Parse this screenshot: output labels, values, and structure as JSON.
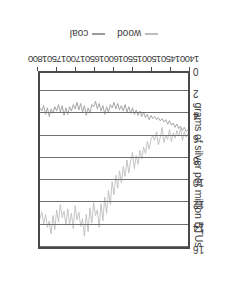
{
  "chart_data": {
    "type": "line",
    "title": "",
    "xlabel": "",
    "ylabel": "grams of silver per million BTUs",
    "xlim": [
      1400,
      1800
    ],
    "ylim": [
      0,
      16
    ],
    "grid": true,
    "legend_position": "bottom",
    "xticks": [
      1400,
      1450,
      1500,
      1550,
      1600,
      1650,
      1700,
      1750,
      1800
    ],
    "yticks": [
      0,
      2,
      4,
      6,
      8,
      10,
      12,
      14,
      16
    ],
    "series": [
      {
        "name": "wood",
        "color": "#bdbdbd",
        "x": [
          1400,
          1405,
          1410,
          1415,
          1420,
          1425,
          1430,
          1435,
          1440,
          1445,
          1450,
          1455,
          1460,
          1465,
          1470,
          1475,
          1480,
          1485,
          1490,
          1495,
          1500,
          1505,
          1510,
          1515,
          1520,
          1525,
          1530,
          1535,
          1540,
          1545,
          1550,
          1555,
          1560,
          1565,
          1570,
          1575,
          1580,
          1585,
          1590,
          1595,
          1600,
          1605,
          1610,
          1615,
          1620,
          1625,
          1630,
          1635,
          1640,
          1645,
          1650,
          1655,
          1660,
          1665,
          1670,
          1675,
          1680,
          1685,
          1690,
          1695,
          1700,
          1705,
          1710,
          1715,
          1720,
          1725,
          1730,
          1735,
          1740,
          1745,
          1750,
          1755,
          1760,
          1765,
          1770,
          1775,
          1780,
          1785,
          1790,
          1795,
          1800
        ],
        "values": [
          5.6,
          5.9,
          5.4,
          6.2,
          5.1,
          5.8,
          5.3,
          6.0,
          5.5,
          6.3,
          5.2,
          6.1,
          5.7,
          6.4,
          5.0,
          5.9,
          6.6,
          5.4,
          6.2,
          5.8,
          6.1,
          7.0,
          6.3,
          7.4,
          6.8,
          7.9,
          7.1,
          8.4,
          7.6,
          8.8,
          7.3,
          8.1,
          9.2,
          8.0,
          9.5,
          8.6,
          10.1,
          9.0,
          10.6,
          9.4,
          11.2,
          10.0,
          12.1,
          10.8,
          12.9,
          11.4,
          13.6,
          12.0,
          14.2,
          12.6,
          13.1,
          11.9,
          13.8,
          12.4,
          14.6,
          13.0,
          15.0,
          13.4,
          14.1,
          12.8,
          13.5,
          12.2,
          14.3,
          12.9,
          13.9,
          12.5,
          14.0,
          12.7,
          13.3,
          12.1,
          13.7,
          12.6,
          14.4,
          13.1,
          14.8,
          13.6,
          14.2,
          13.0,
          13.9,
          12.8,
          13.4
        ]
      },
      {
        "name": "coal",
        "color": "#9a9a9a",
        "x": [
          1400,
          1405,
          1410,
          1415,
          1420,
          1425,
          1430,
          1435,
          1440,
          1445,
          1450,
          1455,
          1460,
          1465,
          1470,
          1475,
          1480,
          1485,
          1490,
          1495,
          1500,
          1505,
          1510,
          1515,
          1520,
          1525,
          1530,
          1535,
          1540,
          1545,
          1550,
          1555,
          1560,
          1565,
          1570,
          1575,
          1580,
          1585,
          1590,
          1595,
          1600,
          1605,
          1610,
          1615,
          1620,
          1625,
          1630,
          1635,
          1640,
          1645,
          1650,
          1655,
          1660,
          1665,
          1670,
          1675,
          1680,
          1685,
          1690,
          1695,
          1700,
          1705,
          1710,
          1715,
          1720,
          1725,
          1730,
          1735,
          1740,
          1745,
          1750,
          1755,
          1760,
          1765,
          1770,
          1775,
          1780,
          1785,
          1790,
          1795,
          1800
        ],
        "values": [
          5.2,
          5.4,
          5.0,
          5.3,
          4.9,
          5.1,
          4.7,
          5.0,
          4.6,
          4.8,
          4.4,
          4.7,
          4.3,
          4.5,
          4.2,
          4.4,
          4.1,
          4.3,
          4.0,
          4.2,
          3.9,
          4.3,
          3.8,
          4.1,
          3.6,
          4.0,
          3.5,
          3.9,
          3.4,
          3.8,
          3.2,
          3.7,
          3.1,
          3.6,
          2.9,
          3.5,
          3.0,
          3.4,
          2.8,
          3.3,
          2.7,
          3.2,
          2.9,
          3.6,
          3.1,
          3.8,
          3.0,
          3.5,
          2.8,
          3.3,
          2.6,
          3.1,
          2.9,
          3.7,
          3.2,
          3.9,
          3.0,
          3.6,
          2.8,
          3.4,
          2.7,
          3.3,
          2.9,
          3.5,
          3.1,
          3.8,
          3.2,
          3.9,
          3.0,
          3.6,
          2.9,
          3.5,
          3.1,
          3.7,
          3.3,
          4.0,
          3.2,
          3.8,
          3.0,
          3.5,
          3.2
        ]
      }
    ],
    "legend": [
      {
        "label": "wood",
        "dash": "—"
      },
      {
        "label": "coal",
        "dash": "—"
      }
    ]
  },
  "axis": {
    "y_title": "grams of silver per million BTUs",
    "y_tick_labels": [
      "16",
      "14",
      "12",
      "10",
      "8",
      "6",
      "4",
      "2",
      "0"
    ],
    "x_tick_labels": [
      "1400",
      "1450",
      "1500",
      "1550",
      "1600",
      "1650",
      "1700",
      "1750",
      "1800"
    ]
  },
  "legend": {
    "wood_label": "wood",
    "coal_label": "coal",
    "dash": "—"
  },
  "colors": {
    "wood": "#bdbdbd",
    "coal": "#9a9a9a",
    "frame": "#4a4a4a",
    "grid": "#6f6f6f",
    "text": "#3b3b3b",
    "background": "#ffffff"
  }
}
